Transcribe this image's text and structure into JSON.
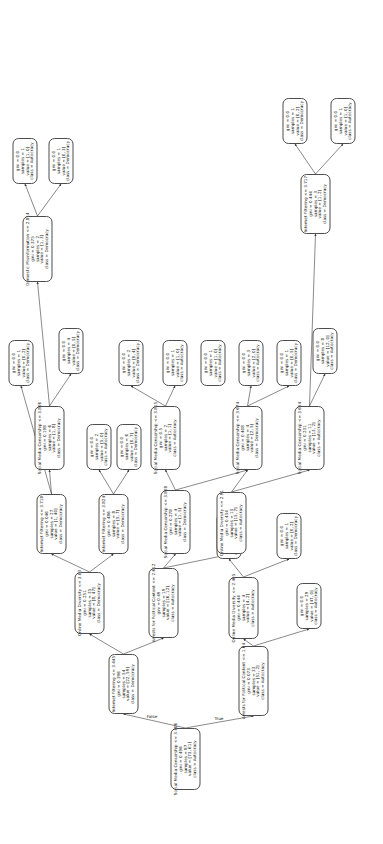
{
  "figure": {
    "type": "decision-tree",
    "orientation": "rotated-90-ccw",
    "edge_labels": {
      "true": "True",
      "false": "False"
    }
  },
  "nodes": {
    "n0": {
      "id": "n0",
      "condition": "Social Media Censorship <= 3.406",
      "gini": "gini = 0.496",
      "samples": "samples = 87",
      "value": "value = [73, 61]",
      "class": "class = Autocracy",
      "x": 54,
      "y": 170,
      "w": 62,
      "h": 30
    },
    "n1": {
      "id": "n1",
      "condition": "Arrests for Political Content <= 1.64",
      "gini": "gini = 0.073",
      "samples": "samples = 33",
      "value": "value = [51, 2]",
      "class": "class = Autocracy",
      "x": 128,
      "y": 238,
      "w": 70,
      "h": 30
    },
    "n2": {
      "id": "n2",
      "gini": "gini = 0.0",
      "samples": "samples = 29",
      "value": "value = [47, 0]",
      "class": "class = Autocracy",
      "x": 215,
      "y": 296,
      "w": 46,
      "h": 25
    },
    "n3": {
      "id": "n3",
      "condition": "Online Media Diversity <= 2.405",
      "gini": "gini = 0.444",
      "samples": "samples = 4",
      "value": "value = [4, 2]",
      "class": "class = Autocracy",
      "x": 205,
      "y": 228,
      "w": 62,
      "h": 30
    },
    "n4": {
      "id": "n4",
      "gini": "gini = 0.0",
      "samples": "samples = 3",
      "value": "value = [4, 0]",
      "class": "class = Autocracy",
      "x": 285,
      "y": 216,
      "w": 46,
      "h": 25
    },
    "n5": {
      "id": "n5",
      "gini": "gini = 0.0",
      "samples": "samples = 1",
      "value": "value = [0, 2]",
      "class": "class = Democracy",
      "x": 285,
      "y": 276,
      "w": 46,
      "h": 25
    },
    "n6": {
      "id": "n6",
      "condition": "Internet Filtering <= 3.445",
      "gini": "gini = 0.396",
      "samples": "samples = 54",
      "value": "value = [22, 59]",
      "class": "class = Democracy",
      "x": 130,
      "y": 108,
      "w": 60,
      "h": 30
    },
    "n7": {
      "id": "n7",
      "condition": "Arrests for Political Content <= 2.612",
      "gini": "gini = 0.49",
      "samples": "samples = 19",
      "value": "value = [16, 12]",
      "class": "class = Autocracy",
      "x": 206,
      "y": 148,
      "w": 70,
      "h": 30
    },
    "n8": {
      "id": "n8",
      "condition": "Online Media Diversity <= 3.03",
      "gini": "gini = 0.251",
      "samples": "samples = 35",
      "value": "value = [8, 47]",
      "class": "class = Democracy",
      "x": 210,
      "y": 74,
      "w": 62,
      "h": 30
    },
    "n9": {
      "id": "n9",
      "condition": "Social Media Censorship <= 3.808",
      "gini": "gini = 0.278",
      "samples": "samples = 4",
      "value": "value = [1, 5]",
      "class": "class = Democracy",
      "x": 290,
      "y": 160,
      "w": 64,
      "h": 30
    },
    "n10": {
      "id": "n10",
      "condition": "Online Media Diversity <= 2.91",
      "gini": "gini = 0.434",
      "samples": "samples = 15",
      "value": "value = [15, 7]",
      "class": "class = Autocracy",
      "x": 290,
      "y": 216,
      "w": 62,
      "h": 30
    },
    "n11": {
      "id": "n11",
      "condition": "Social Media Censorship <= 3.815",
      "gini": "gini = 0.5",
      "samples": "samples = 2",
      "value": "value = [1, 1]",
      "class": "class = Autocracy",
      "x": 374,
      "y": 150,
      "w": 64,
      "h": 30
    },
    "n12": {
      "id": "n12",
      "gini": "gini = 0.0",
      "samples": "samples = 2",
      "value": "value = [0, 4]",
      "class": "class = Democracy",
      "x": 458,
      "y": 118,
      "w": 46,
      "h": 25
    },
    "n13": {
      "id": "n13",
      "gini": "gini = 0.0",
      "samples": "samples = 1",
      "value": "value = [1, 0]",
      "class": "class = Autocracy",
      "x": 458,
      "y": 162,
      "w": 46,
      "h": 25
    },
    "n14": {
      "id": "n14",
      "gini": "gini = 0.0",
      "samples": "samples = 1",
      "value": "value = [1, 0]",
      "class": "class = Autocracy",
      "x": 458,
      "y": 200,
      "w": 46,
      "h": 25
    },
    "n15": {
      "id": "n15",
      "condition": "Social Media Censorship <= 3.674",
      "gini": "gini = 0.408",
      "samples": "samples = 4",
      "value": "value = [2, 5]",
      "class": "class = Democracy",
      "x": 374,
      "y": 232,
      "w": 64,
      "h": 30
    },
    "n16": {
      "id": "n16",
      "gini": "gini = 0.0",
      "samples": "samples = 3",
      "value": "value = [2, 0]",
      "class": "class = Autocracy",
      "x": 458,
      "y": 238,
      "w": 46,
      "h": 25
    },
    "n17": {
      "id": "n17",
      "gini": "gini = 0.0",
      "samples": "samples = 1",
      "value": "value = [0, 5]",
      "class": "class = Democracy",
      "x": 458,
      "y": 276,
      "w": 46,
      "h": 25
    },
    "n18": {
      "id": "n18",
      "condition": "Social Media Censorship <= 3.654",
      "gini": "gini = 0.231",
      "samples": "samples = 11",
      "value": "value = [13, 2]",
      "class": "class = Autocracy",
      "x": 374,
      "y": 294,
      "w": 64,
      "h": 30
    },
    "n19": {
      "id": "n19",
      "gini": "gini = 0.0",
      "samples": "samples = 8",
      "value": "value = [12, 0]",
      "class": "class = Autocracy",
      "x": 470,
      "y": 312,
      "w": 46,
      "h": 25
    },
    "n20": {
      "id": "n20",
      "condition": "Internet Filtering <= 3.717",
      "gini": "gini = 0.444",
      "samples": "samples = 3",
      "value": "value = [1, 2]",
      "class": "class = Democracy",
      "x": 610,
      "y": 300,
      "w": 60,
      "h": 30
    },
    "n21": {
      "id": "n21",
      "gini": "gini = 0.0",
      "samples": "samples = 1",
      "value": "value = [0, 2]",
      "class": "class = Democracy",
      "x": 700,
      "y": 282,
      "w": 46,
      "h": 25
    },
    "n22": {
      "id": "n22",
      "gini": "gini = 0.0",
      "samples": "samples = 1",
      "value": "value = [1, 0]",
      "class": "class = Autocracy",
      "x": 700,
      "y": 330,
      "w": 46,
      "h": 25
    },
    "n23": {
      "id": "n23",
      "condition": "Internet Filtering <= 3.718",
      "gini": "gini = 0.046",
      "samples": "samples = 27",
      "value": "value = [1, 40]",
      "class": "class = Democracy",
      "x": 290,
      "y": 36,
      "w": 60,
      "h": 30
    },
    "n24": {
      "id": "n24",
      "condition": "Internet Filtering <= 3.824",
      "gini": "gini = 0.486",
      "samples": "samples = 8",
      "value": "value = [5, 7]",
      "class": "class = Democracy",
      "x": 290,
      "y": 98,
      "w": 60,
      "h": 30
    },
    "n25": {
      "id": "n25",
      "gini": "gini = 0.0",
      "samples": "samples = 2",
      "value": "value = [5, 0]",
      "class": "class = Autocracy",
      "x": 374,
      "y": 86,
      "w": 46,
      "h": 25
    },
    "n26": {
      "id": "n26",
      "gini": "gini = 0.0",
      "samples": "samples = 6",
      "value": "value = [0, 7]",
      "class": "class = Democracy",
      "x": 374,
      "y": 116,
      "w": 46,
      "h": 25
    },
    "n27": {
      "id": "n27",
      "condition": "Social Media Censorship <= 3.806",
      "gini": "gini = 0.198",
      "samples": "samples = 6",
      "value": "value = [1, 8]",
      "class": "class = Democracy",
      "x": 374,
      "y": 34,
      "w": 64,
      "h": 30
    },
    "n28": {
      "id": "n28",
      "gini": "gini = 0.0",
      "samples": "samples = 4",
      "value": "value = [0, 5]",
      "class": "class = Democracy",
      "x": 470,
      "y": 58,
      "w": 46,
      "h": 25
    },
    "n29": {
      "id": "n29",
      "condition": "Domestic Misinformation <= 2.814",
      "gini": "gini = 0.375",
      "samples": "samples = 2",
      "value": "value = [1, 3]",
      "class": "class = Democracy",
      "x": 562,
      "y": 22,
      "w": 66,
      "h": 30
    },
    "n30": {
      "id": "n30",
      "gini": "gini = 0.0",
      "samples": "samples = 1",
      "value": "value = [1, 0]",
      "class": "class = Autocracy",
      "x": 660,
      "y": 12,
      "w": 46,
      "h": 25
    },
    "n31": {
      "id": "n31",
      "gini": "gini = 0.0",
      "samples": "samples = 1",
      "value": "value = [0, 3]",
      "class": "class = Democracy",
      "x": 660,
      "y": 48,
      "w": 46,
      "h": 25
    },
    "n32": {
      "id": "n32",
      "gini": "gini = 0.0",
      "samples": "samples = 1",
      "value": "value = [0, 2]",
      "class": "class = Democracy",
      "x": 458,
      "y": 8,
      "w": 46,
      "h": 25
    }
  },
  "node_order": [
    "n0",
    "n1",
    "n2",
    "n3",
    "n4",
    "n5",
    "n6",
    "n7",
    "n8",
    "n9",
    "n10",
    "n11",
    "n12",
    "n13",
    "n14",
    "n15",
    "n16",
    "n17",
    "n18",
    "n19",
    "n20",
    "n21",
    "n22",
    "n23",
    "n24",
    "n25",
    "n26",
    "n27",
    "n28",
    "n29",
    "n30",
    "n31",
    "n32"
  ],
  "edges": [
    [
      "n0",
      "n1"
    ],
    [
      "n0",
      "n6"
    ],
    [
      "n1",
      "n3"
    ],
    [
      "n1",
      "n2"
    ],
    [
      "n3",
      "n4"
    ],
    [
      "n3",
      "n5"
    ],
    [
      "n6",
      "n8"
    ],
    [
      "n6",
      "n7"
    ],
    [
      "n7",
      "n9"
    ],
    [
      "n7",
      "n10"
    ],
    [
      "n8",
      "n23"
    ],
    [
      "n8",
      "n24"
    ],
    [
      "n23",
      "n27"
    ],
    [
      "n23",
      "n32"
    ],
    [
      "n27",
      "n29"
    ],
    [
      "n27",
      "n28"
    ],
    [
      "n29",
      "n30"
    ],
    [
      "n29",
      "n31"
    ],
    [
      "n24",
      "n25"
    ],
    [
      "n24",
      "n26"
    ],
    [
      "n9",
      "n11"
    ],
    [
      "n9",
      "n15"
    ],
    [
      "n11",
      "n12"
    ],
    [
      "n11",
      "n13"
    ],
    [
      "n10",
      "n15"
    ],
    [
      "n10",
      "n18"
    ],
    [
      "n15",
      "n16"
    ],
    [
      "n15",
      "n17"
    ],
    [
      "n18",
      "n19"
    ],
    [
      "n18",
      "n20"
    ],
    [
      "n20",
      "n21"
    ],
    [
      "n20",
      "n22"
    ]
  ]
}
